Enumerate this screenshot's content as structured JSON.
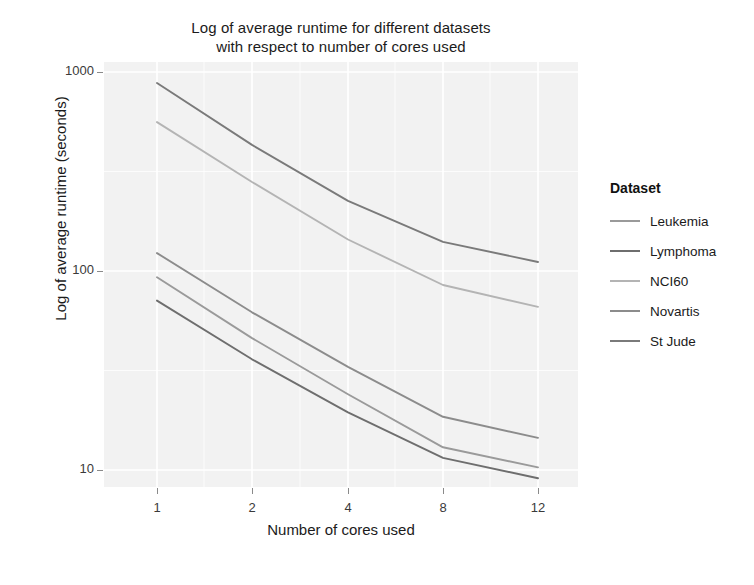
{
  "chart_data": {
    "type": "line",
    "title": "Log of average runtime for different datasets with respect to number of cores used",
    "title_line1": "Log of average runtime for different datasets",
    "title_line2": "with respect to number of cores used",
    "xlabel": "Number of cores used",
    "ylabel": "Log of average runtime (seconds)",
    "yscale": "log",
    "ylim": [
      8,
      1200
    ],
    "y_ticks": [
      1000,
      100,
      10
    ],
    "y_tick_labels": [
      "1000",
      "100",
      "10"
    ],
    "x": [
      1,
      2,
      4,
      8,
      12
    ],
    "x_tick_labels": [
      "1",
      "2",
      "4",
      "8",
      "12"
    ],
    "categories": [
      "1",
      "2",
      "4",
      "8",
      "12"
    ],
    "grid": true,
    "legend_title": "Dataset",
    "legend_position": "right",
    "series": [
      {
        "name": "Leukemia",
        "color": "#9a9a9a",
        "values": [
          93,
          46,
          24,
          13,
          10.3
        ]
      },
      {
        "name": "Lymphoma",
        "color": "#6e6e6e",
        "values": [
          71,
          36,
          19.5,
          11.5,
          9.1
        ]
      },
      {
        "name": "NCI60",
        "color": "#b4b4b4",
        "values": [
          560,
          280,
          144,
          85,
          66
        ]
      },
      {
        "name": "Novartis",
        "color": "#8c8c8c",
        "values": [
          123,
          62,
          33,
          18.5,
          14.5
        ]
      },
      {
        "name": "St Jude",
        "color": "#7a7a7a",
        "values": [
          880,
          430,
          225,
          140,
          111
        ]
      }
    ]
  },
  "style": {
    "panel_bg": "#f2f2f2",
    "grid_color": "#ffffff",
    "text_color": "#1b1b1b",
    "tick_color": "#3a3a3a"
  }
}
